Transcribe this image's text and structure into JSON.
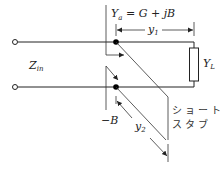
{
  "diagram": {
    "type": "single-stub-matching-circuit",
    "labels": {
      "admittance_point": {
        "main": "Y",
        "sub": "a",
        "rest": " = G + jB"
      },
      "input_impedance": {
        "main": "Z",
        "sub": "in"
      },
      "load": {
        "main": "Y",
        "sub": "L"
      },
      "distance_to_load": {
        "main": "y",
        "sub": "1"
      },
      "stub_length": {
        "main": "y",
        "sub": "2"
      },
      "stub_susceptance": "−B",
      "stub_name_line1": "ショート",
      "stub_name_line2": "スタブ"
    },
    "nodes": [
      {
        "name": "input-terminal-top",
        "x": 15,
        "y": 42
      },
      {
        "name": "input-terminal-bottom",
        "x": 15,
        "y": 87
      },
      {
        "name": "junction-top",
        "x": 116,
        "y": 42
      },
      {
        "name": "junction-bottom",
        "x": 116,
        "y": 87
      }
    ],
    "colors": {
      "line": "#222222",
      "background": "#ffffff"
    }
  }
}
